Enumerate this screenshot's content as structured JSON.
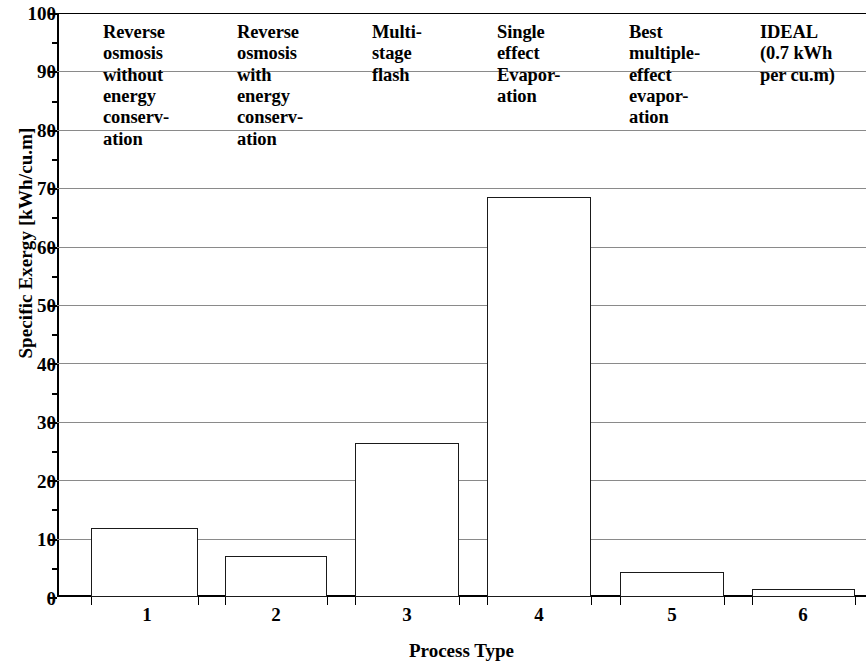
{
  "chart_data": {
    "type": "bar",
    "title": "",
    "xlabel": "Process Type",
    "ylabel": "Specific Exergy [kWh/cu.m]",
    "categories": [
      "1",
      "2",
      "3",
      "4",
      "5",
      "6"
    ],
    "values": [
      11.8,
      7.0,
      26.4,
      68.5,
      4.3,
      1.3
    ],
    "ylim": [
      0,
      100
    ],
    "ytick_values": [
      0,
      10,
      20,
      30,
      40,
      50,
      60,
      70,
      80,
      90,
      100
    ],
    "ytick_labels": [
      "0",
      "10",
      "20",
      "30",
      "40",
      "50",
      "60",
      "70",
      "80",
      "90",
      "100"
    ],
    "yminor_step": 5,
    "grid": true,
    "legend": "none",
    "bar_fill": "#ffffff",
    "bar_edge": "#1a1a1a",
    "grid_color": "#8a8a8a",
    "axis_color": "#000000",
    "annotations": [
      {
        "category": "1",
        "text": "Reverse\nosmosis\nwithout\nenergy\nconserv-\nation"
      },
      {
        "category": "2",
        "text": "Reverse\nosmosis\nwith\nenergy\nconserv-\nation"
      },
      {
        "category": "3",
        "text": "Multi-\nstage\nflash"
      },
      {
        "category": "4",
        "text": "Single\neffect\nEvapor-\nation"
      },
      {
        "category": "5",
        "text": "Best\nmultiple-\neffect\nevapor-\nation"
      },
      {
        "category": "6",
        "text": "IDEAL\n(0.7 kWh\nper cu.m)"
      }
    ]
  }
}
